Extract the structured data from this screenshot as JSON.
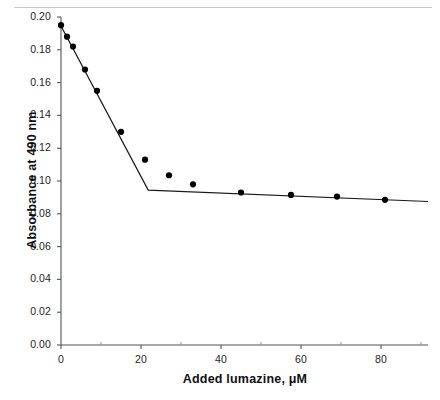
{
  "figure": {
    "background_color": "#ffffff",
    "top_rule_color": "#c8c8c8",
    "axis_color": "#555555",
    "series_color": "#000000"
  },
  "chart_data": {
    "type": "scatter",
    "title": "",
    "subtitle": "",
    "xlabel": "Added lumazine, μM",
    "ylabel": "Absorbance at 490 nm",
    "xlim": [
      0,
      91.75
    ],
    "ylim": [
      0.0,
      0.2
    ],
    "xticks": [
      0,
      20,
      40,
      60,
      80
    ],
    "xticklabels": [
      "0",
      "20",
      "40",
      "60",
      "80"
    ],
    "xticks_minor": [
      10,
      30,
      50,
      70,
      90
    ],
    "yticks": [
      0.0,
      0.02,
      0.04,
      0.06,
      0.08,
      0.1,
      0.12,
      0.14,
      0.16,
      0.18,
      0.2
    ],
    "yticklabels": [
      "0.00",
      "0.02",
      "0.04",
      "0.06",
      "0.08",
      "0.10",
      "0.12",
      "0.14",
      "0.16",
      "0.18",
      "0.20"
    ],
    "grid": false,
    "legend": false,
    "legend_position": "none",
    "series": [
      {
        "name": "Absorbance at 490 nm",
        "marker": "filled-circle",
        "marker_color": "#000000",
        "x": [
          0.0,
          1.5,
          3.0,
          6.0,
          9.0,
          15.0,
          21.0,
          27.0,
          33.0,
          45.0,
          57.5,
          69.0,
          81.0
        ],
        "y": [
          0.195,
          0.188,
          0.182,
          0.168,
          0.155,
          0.13,
          0.113,
          0.1035,
          0.098,
          0.093,
          0.0915,
          0.0905,
          0.0885
        ]
      },
      {
        "name": "Two-segment linear fit",
        "marker": "none",
        "line_color": "#1a1a1a",
        "x": [
          0.0,
          21.8,
          91.75
        ],
        "y": [
          0.1945,
          0.0945,
          0.0875
        ]
      }
    ],
    "annotations": [],
    "breakpoint": {
      "x": 21.8,
      "y": 0.0945
    }
  }
}
